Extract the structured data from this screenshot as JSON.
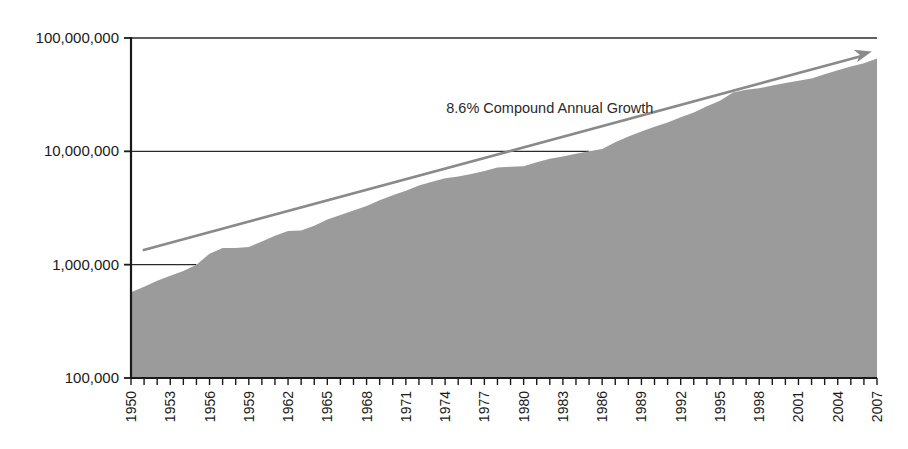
{
  "chart_data": {
    "type": "area",
    "title": "",
    "subtitle": "",
    "xlabel": "",
    "ylabel": "",
    "log_scale": true,
    "grid": true,
    "legend_position": "none",
    "ylim": [
      100000,
      100000000
    ],
    "ytick_labels": [
      "100,000,000",
      "10,000,000",
      "1,000,000",
      "100,000"
    ],
    "ytick_values": [
      100000000,
      10000000,
      1000000,
      100000
    ],
    "xlim": [
      1950,
      2007
    ],
    "xtick_labels": [
      "1950",
      "1953",
      "1956",
      "1959",
      "1962",
      "1965",
      "1968",
      "1971",
      "1974",
      "1977",
      "1980",
      "1983",
      "1986",
      "1989",
      "1992",
      "1995",
      "1998",
      "2001",
      "2004",
      "2007"
    ],
    "xtick_values": [
      1950,
      1953,
      1956,
      1959,
      1962,
      1965,
      1968,
      1971,
      1974,
      1977,
      1980,
      1983,
      1986,
      1989,
      1992,
      1995,
      1998,
      2001,
      2004,
      2007
    ],
    "annotations": [
      {
        "text": "8.6% Compound Annual Growth",
        "x": 1982,
        "y": 22000000
      }
    ],
    "colors": {
      "area_fill": "#9b9b9b",
      "axis": "#1a1a1a",
      "gridline": "#2b2b2b",
      "trend_arrow": "#8a8a8a",
      "text": "#1a1a1a"
    },
    "trend_line": {
      "label": "8.6% Compound Annual Growth",
      "growth_rate_percent": 8.6,
      "start": {
        "x": 1950.9,
        "y": 1340000
      },
      "end": {
        "x": 2006.6,
        "y": 76000000
      },
      "arrowhead": true
    },
    "x": [
      1950,
      1951,
      1952,
      1953,
      1954,
      1955,
      1956,
      1957,
      1958,
      1959,
      1960,
      1961,
      1962,
      1963,
      1964,
      1965,
      1966,
      1967,
      1968,
      1969,
      1970,
      1971,
      1972,
      1973,
      1974,
      1975,
      1976,
      1977,
      1978,
      1979,
      1980,
      1981,
      1982,
      1983,
      1984,
      1985,
      1986,
      1987,
      1988,
      1989,
      1990,
      1991,
      1992,
      1993,
      1994,
      1995,
      1996,
      1997,
      1998,
      1999,
      2000,
      2001,
      2002,
      2003,
      2004,
      2005,
      2006,
      2007
    ],
    "values": [
      570000,
      640000,
      720000,
      800000,
      880000,
      1000000,
      1250000,
      1400000,
      1400000,
      1430000,
      1600000,
      1800000,
      1980000,
      2000000,
      2200000,
      2500000,
      2750000,
      3000000,
      3300000,
      3700000,
      4100000,
      4500000,
      5000000,
      5400000,
      5800000,
      6000000,
      6300000,
      6700000,
      7200000,
      7300000,
      7400000,
      8000000,
      8600000,
      9000000,
      9500000,
      10000000,
      10500000,
      12000000,
      13500000,
      15000000,
      16500000,
      18000000,
      20000000,
      22000000,
      25000000,
      28000000,
      33000000,
      35000000,
      36000000,
      38000000,
      40000000,
      42000000,
      44000000,
      48000000,
      52000000,
      56000000,
      60000000,
      66000000
    ]
  }
}
